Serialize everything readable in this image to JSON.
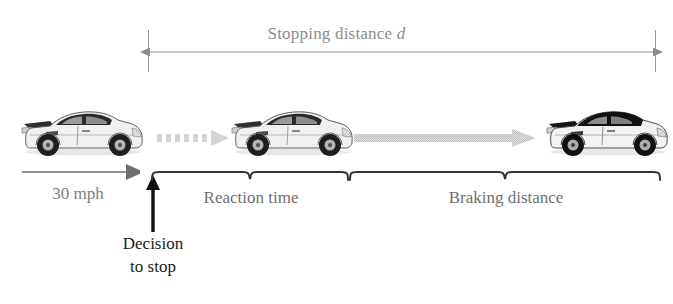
{
  "figure": {
    "kind": "physics-diagram",
    "background_color": "#ffffff"
  },
  "dimension": {
    "label_text": "Stopping distance",
    "label_variable": "d",
    "color": "#8d8d8d",
    "left_tick_x": 148,
    "right_tick_x": 655,
    "arrow_style": "double-headed"
  },
  "speed": {
    "label": "30 mph",
    "color": "#7e7e7e",
    "arrow_direction": "right"
  },
  "decision": {
    "line1": "Decision",
    "line2": "to stop",
    "color": "#1a1a1a",
    "arrow_direction": "up"
  },
  "segments": [
    {
      "id": "reaction",
      "label": "Reaction time",
      "brace_start_x": 152,
      "brace_end_x": 348,
      "motion_arrow_style": "dotted",
      "motion_arrow_color": "#d2d2d2"
    },
    {
      "id": "braking",
      "label": "Braking distance",
      "brace_start_x": 350,
      "brace_end_x": 660,
      "motion_arrow_style": "solid-textured",
      "motion_arrow_color": "#cfcfcf"
    }
  ],
  "cars": [
    {
      "id": "car-start",
      "position_label": "before decision",
      "x": 20,
      "body_color": "#f2f2f2",
      "accent_color": "#3a3a3a"
    },
    {
      "id": "car-reacting",
      "position_label": "end of reaction",
      "x": 230,
      "body_color": "#f2f2f2",
      "accent_color": "#3a3a3a"
    },
    {
      "id": "car-stopped",
      "position_label": "stopped",
      "x": 545,
      "body_color": "#f2f2f2",
      "accent_color": "#1c1c1c"
    }
  ],
  "brace_color": "#333333"
}
